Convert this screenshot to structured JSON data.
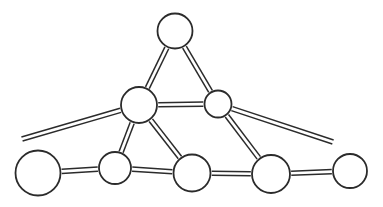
{
  "canvas": {
    "width": 383,
    "height": 207,
    "background": "#ffffff",
    "title": "Undirected graph diagram with eight circular nodes"
  },
  "style": {
    "node_stroke_color": "#2b2b2b",
    "node_fill_color": "#ffffff",
    "node_stroke_width": 1.8,
    "edge_stroke_color": "#2b2b2b",
    "edge_stroke_width": 1.5,
    "edge_rail_gap": 4.2,
    "edge_style": "double-parallel-line"
  },
  "graph": {
    "node_count": 8,
    "edge_count": 10,
    "nodes": [
      {
        "id": "n-top",
        "label": "top-node",
        "cx": 175,
        "cy": 31,
        "r": 17.5
      },
      {
        "id": "n-mid-left",
        "label": "middle-left-node",
        "cx": 139,
        "cy": 105,
        "r": 18.0
      },
      {
        "id": "n-mid-right",
        "label": "middle-right-node",
        "cx": 218,
        "cy": 104,
        "r": 13.5
      },
      {
        "id": "n-b1",
        "label": "bottom-node-1",
        "cx": 38,
        "cy": 173,
        "r": 22.5
      },
      {
        "id": "n-b2",
        "label": "bottom-node-2",
        "cx": 115,
        "cy": 168,
        "r": 16.0
      },
      {
        "id": "n-b3",
        "label": "bottom-node-3",
        "cx": 192,
        "cy": 173,
        "r": 18.5
      },
      {
        "id": "n-b4",
        "label": "bottom-node-4",
        "cx": 271,
        "cy": 174,
        "r": 19.0
      },
      {
        "id": "n-b5",
        "label": "bottom-node-5",
        "cx": 350,
        "cy": 171,
        "r": 17.0
      }
    ],
    "edges": [
      {
        "id": "e-top-midleft",
        "label": "top-to-middle-left",
        "from": "n-top",
        "to": "n-mid-left",
        "dangling_to": false
      },
      {
        "id": "e-top-midright",
        "label": "top-to-middle-right",
        "from": "n-top",
        "to": "n-mid-right",
        "dangling_to": false
      },
      {
        "id": "e-mid-mid",
        "label": "middle-left-to-middle-right",
        "from": "n-mid-left",
        "to": "n-mid-right",
        "dangling_to": false
      },
      {
        "id": "e-midleft-far-l",
        "label": "middle-left-long-left-stub",
        "from": "n-mid-left",
        "to": [
          22,
          139
        ],
        "dangling_to": true
      },
      {
        "id": "e-midleft-b2",
        "label": "middle-left-to-bottom-2",
        "from": "n-mid-left",
        "to": "n-b2",
        "dangling_to": false
      },
      {
        "id": "e-midleft-b3",
        "label": "middle-left-to-bottom-3",
        "from": "n-mid-left",
        "to": "n-b3",
        "dangling_to": false
      },
      {
        "id": "e-midright-far-r",
        "label": "middle-right-long-right-stub",
        "from": "n-mid-right",
        "to": [
          333,
          142
        ],
        "dangling_to": true
      },
      {
        "id": "e-midright-b4",
        "label": "middle-right-to-bottom-4",
        "from": "n-mid-right",
        "to": "n-b4",
        "dangling_to": false
      },
      {
        "id": "e-b1-b2",
        "label": "bottom-1-to-bottom-2",
        "from": "n-b1",
        "to": "n-b2",
        "dangling_to": false
      },
      {
        "id": "e-b2-b3",
        "label": "bottom-2-to-bottom-3",
        "from": "n-b2",
        "to": "n-b3",
        "dangling_to": false
      },
      {
        "id": "e-b3-b4",
        "label": "bottom-3-to-bottom-4",
        "from": "n-b3",
        "to": "n-b4",
        "dangling_to": false
      },
      {
        "id": "e-b4-b5",
        "label": "bottom-4-to-bottom-5",
        "from": "n-b4",
        "to": "n-b5",
        "dangling_to": false
      }
    ]
  }
}
